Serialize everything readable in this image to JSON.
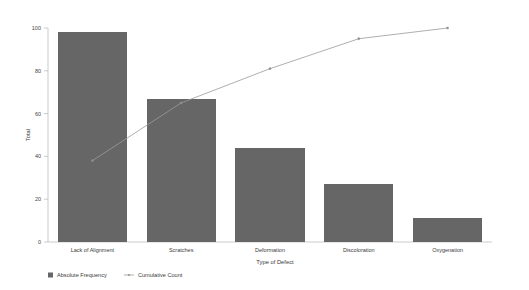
{
  "chart_data": {
    "type": "bar",
    "title": "",
    "subtitle": "",
    "xlabel": "Type of Defect",
    "ylabel": "Total",
    "categories": [
      "Lack of Alignment",
      "Scratches",
      "Deformation",
      "Discoloration",
      "Oxygenation"
    ],
    "ylim": [
      0,
      100
    ],
    "yticks": [
      0,
      20,
      40,
      60,
      80,
      100
    ],
    "ytick_labels": [
      "0",
      "20",
      "40",
      "60",
      "80",
      "100"
    ],
    "grid": false,
    "legend_position": "bottom-left",
    "series": [
      {
        "name": "Absolute Frequency",
        "type": "bar",
        "color": "#666666",
        "values": [
          98,
          67,
          44,
          27,
          11
        ]
      },
      {
        "name": "Cumulative Count",
        "type": "line",
        "color": "#9a9a9a",
        "marker": "dot",
        "values": [
          38,
          65,
          81,
          95,
          100
        ]
      }
    ],
    "legend": [
      {
        "label": "Absolute Frequency",
        "swatch": "square",
        "color": "#666666"
      },
      {
        "label": "Cumulative Count",
        "swatch": "line-marker",
        "color": "#9a9a9a"
      }
    ]
  }
}
